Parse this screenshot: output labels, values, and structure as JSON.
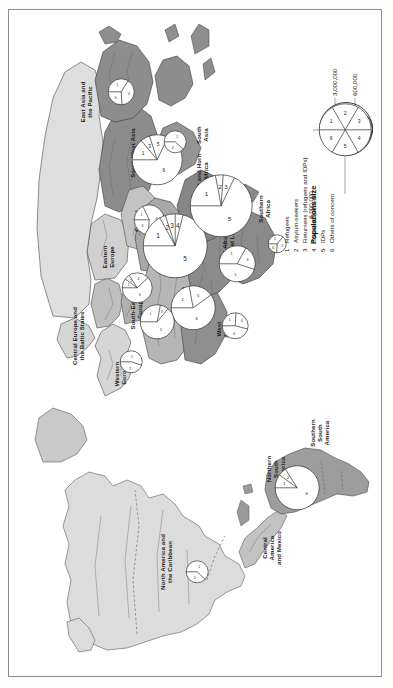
{
  "figure": {
    "orientation": "landscape-rotated-90ccw",
    "background_color": "#ffffff",
    "border_color": "#8d8d8d"
  },
  "legend": {
    "title": "Populations size",
    "size_scale": [
      {
        "label": "6,000,000",
        "radius_px": 26
      },
      {
        "label": "3,000,000",
        "radius_px": 18
      },
      {
        "label": "600,000",
        "radius_px": 8
      }
    ],
    "items": [
      {
        "num": "1",
        "label": "Refugees"
      },
      {
        "num": "2",
        "label": "Asylum-seekers"
      },
      {
        "num": "3",
        "label": "Returnees (refugees and IDPs)"
      },
      {
        "num": "4",
        "label": "Stateless persons"
      },
      {
        "num": "5",
        "label": "IDPs"
      },
      {
        "num": "6",
        "label": "Others of concern"
      }
    ],
    "sample_pie_segments": [
      "1",
      "2",
      "3",
      "4",
      "5",
      "6"
    ]
  },
  "map": {
    "shades": {
      "dark": "#8e8e8e",
      "mid": "#b4b4b4",
      "light": "#d2d2d2",
      "pale": "#e3e3e3",
      "outline": "#4a4a4a"
    },
    "regions": [
      {
        "id": "east-asia-and-the-pacific",
        "label": "East Asia and\nthe Pacific"
      },
      {
        "id": "south-west-asia",
        "label": "South-West Asia"
      },
      {
        "id": "south-asia",
        "label": "South\nAsia"
      },
      {
        "id": "central-asia",
        "label": "Central\nAsia"
      },
      {
        "id": "eastern-europe",
        "label": "Eastern\nEurope"
      },
      {
        "id": "east-and-horn-of-africa",
        "label": "East and Horn\nof Africa"
      },
      {
        "id": "southern-africa",
        "label": "Southern\nAfrica"
      },
      {
        "id": "middle-east",
        "label": "Middle\nEast"
      },
      {
        "id": "central-europe-and-the-baltic-states",
        "label": "Central Europe and\nthe Baltic States"
      },
      {
        "id": "western-europe",
        "label": "Western\nEurope"
      },
      {
        "id": "south-eastern-europe",
        "label": "South-Eastern\nEurope"
      },
      {
        "id": "north-africa",
        "label": "North Africa"
      },
      {
        "id": "west-africa",
        "label": "West\nAfrica"
      },
      {
        "id": "central-africa-and-the-great-lakes",
        "label": "Central Africa and\nthe Great Lakes"
      },
      {
        "id": "northern-south-america",
        "label": "Northern\nSouth\nAmerica"
      },
      {
        "id": "southern-south-america",
        "label": "Southern\nSouth\nAmerica"
      },
      {
        "id": "central-america-and-mexico",
        "label": "Central\nAmerica\nand Mexico"
      },
      {
        "id": "north-america-and-the-caribbean",
        "label": "North America and\nthe Caribbean"
      }
    ]
  },
  "chart_data": {
    "type": "pie",
    "legend_entries": [
      "Refugees",
      "Asylum-seekers",
      "Returnees (refugees and IDPs)",
      "Stateless persons",
      "IDPs",
      "Others of concern"
    ],
    "size_legend": [
      "6,000,000",
      "3,000,000",
      "600,000"
    ],
    "units": "persons",
    "charts": [
      {
        "region": "East Asia and the Pacific",
        "radius_px": 13,
        "slices": [
          {
            "num": "1",
            "share": 0.34
          },
          {
            "num": "4",
            "share": 0.4
          },
          {
            "num": "6",
            "share": 0.26
          }
        ]
      },
      {
        "region": "South-West Asia",
        "radius_px": 25,
        "slices": [
          {
            "num": "1",
            "share": 0.14
          },
          {
            "num": "3",
            "share": 0.06
          },
          {
            "num": "5",
            "share": 0.12
          },
          {
            "num": "6",
            "share": 0.68
          }
        ]
      },
      {
        "region": "Central Asia",
        "radius_px": 15,
        "slices": [
          {
            "num": "1",
            "share": 0.18
          },
          {
            "num": "4",
            "share": 0.58
          },
          {
            "num": "6",
            "share": 0.24
          }
        ]
      },
      {
        "region": "Eastern Europe",
        "radius_px": 15,
        "slices": [
          {
            "num": "1",
            "share": 0.1
          },
          {
            "num": "2",
            "share": 0.06
          },
          {
            "num": "4",
            "share": 0.22
          },
          {
            "num": "6",
            "share": 0.62
          }
        ]
      },
      {
        "region": "Middle East",
        "radius_px": 32,
        "slices": [
          {
            "num": "1",
            "share": 0.17
          },
          {
            "num": "2",
            "share": 0.03
          },
          {
            "num": "3",
            "share": 0.05
          },
          {
            "num": "4",
            "share": 0.04
          },
          {
            "num": "5",
            "share": 0.71
          }
        ]
      },
      {
        "region": "North Africa",
        "radius_px": 22,
        "slices": [
          {
            "num": "1",
            "share": 0.22
          },
          {
            "num": "5",
            "share": 0.18
          },
          {
            "num": "6",
            "share": 0.6
          }
        ]
      },
      {
        "region": "South-Eastern Europe",
        "radius_px": 17,
        "slices": [
          {
            "num": "1",
            "share": 0.28
          },
          {
            "num": "3",
            "share": 0.08
          },
          {
            "num": "5",
            "share": 0.64
          }
        ]
      },
      {
        "region": "Western Europe",
        "radius_px": 11,
        "slices": [
          {
            "num": "1",
            "share": 0.55
          },
          {
            "num": "2",
            "share": 0.45
          }
        ]
      },
      {
        "region": "East and Horn of Africa",
        "radius_px": 31,
        "slices": [
          {
            "num": "1",
            "share": 0.22
          },
          {
            "num": "2",
            "share": 0.04
          },
          {
            "num": "3",
            "share": 0.06
          },
          {
            "num": "5",
            "share": 0.68
          }
        ]
      },
      {
        "region": "Central Africa and the Great Lakes",
        "radius_px": 18,
        "slices": [
          {
            "num": "1",
            "share": 0.33
          },
          {
            "num": "3",
            "share": 0.22
          },
          {
            "num": "5",
            "share": 0.45
          }
        ]
      },
      {
        "region": "West Africa",
        "radius_px": 13,
        "slices": [
          {
            "num": "1",
            "share": 0.26
          },
          {
            "num": "4",
            "share": 0.28
          },
          {
            "num": "6",
            "share": 0.46
          }
        ]
      },
      {
        "region": "Southern Africa",
        "radius_px": 9,
        "slices": [
          {
            "num": "1",
            "share": 0.36
          },
          {
            "num": "2",
            "share": 0.4
          },
          {
            "num": "6",
            "share": 0.24
          }
        ]
      },
      {
        "region": "South Asia",
        "radius_px": 11,
        "slices": [
          {
            "num": "1",
            "share": 0.62
          },
          {
            "num": "4",
            "share": 0.38
          }
        ]
      },
      {
        "region": "Northern South America",
        "radius_px": 22,
        "slices": [
          {
            "num": "1",
            "share": 0.1
          },
          {
            "num": "2",
            "share": 0.06
          },
          {
            "num": "6",
            "share": 0.84
          }
        ]
      },
      {
        "region": "North America and the Caribbean",
        "radius_px": 11,
        "slices": [
          {
            "num": "1",
            "share": 0.62
          },
          {
            "num": "2",
            "share": 0.38
          }
        ]
      }
    ]
  }
}
